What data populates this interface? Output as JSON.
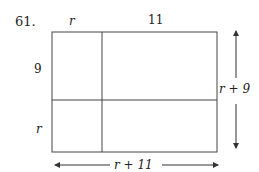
{
  "problem": {
    "number": "61.",
    "labels": {
      "top_left": "r",
      "top_right": "11",
      "left_top": "9",
      "left_bottom": "r",
      "right": "r + 9",
      "bottom": "r + 11"
    }
  }
}
